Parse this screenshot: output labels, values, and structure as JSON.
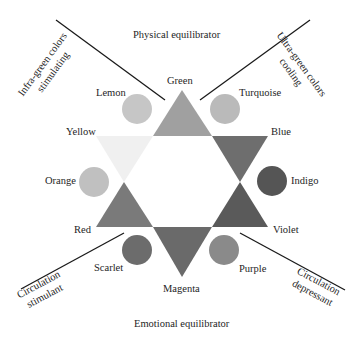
{
  "title_top": "Physical equilibrator",
  "title_bottom": "Emotional equilibrator",
  "regions": {
    "top_left": [
      "Infra-green colors",
      "stimulating"
    ],
    "top_right": [
      "Ultra-green colors",
      "cooling"
    ],
    "bottom_left": [
      "Circulation",
      "stimulant"
    ],
    "bottom_right": [
      "Circulation",
      "depressant"
    ]
  },
  "triangles": [
    {
      "name": "Green",
      "color": "#a0a0a0"
    },
    {
      "name": "Blue",
      "color": "#6e6e6e"
    },
    {
      "name": "Violet",
      "color": "#5a5a5a"
    },
    {
      "name": "Magenta",
      "color": "#6a6a6a"
    },
    {
      "name": "Red",
      "color": "#7a7a7a"
    },
    {
      "name": "Yellow",
      "color": "#f0f0f0"
    }
  ],
  "circles": [
    {
      "name": "Lemon",
      "color": "#c6c6c6"
    },
    {
      "name": "Turquoise",
      "color": "#bababa"
    },
    {
      "name": "Indigo",
      "color": "#555555"
    },
    {
      "name": "Purple",
      "color": "#8a8a8a"
    },
    {
      "name": "Scarlet",
      "color": "#6c6c6c"
    },
    {
      "name": "Orange",
      "color": "#c0c0c0"
    }
  ]
}
